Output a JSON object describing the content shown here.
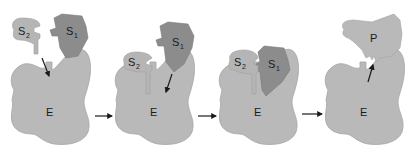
{
  "diagram": {
    "type": "enzyme-substrate mechanism",
    "colors": {
      "enzyme": "#b9b9b9",
      "substrate2": "#b5b5b5",
      "substrate1": "#8c8c8c",
      "product": "#b9b9b9",
      "outline": "#9a9a9a",
      "arrow": "#1a1a1a"
    },
    "panels": [
      {
        "step": 1,
        "enzyme_label": "E",
        "s2_label": "S",
        "s2_sub": "2",
        "s1_label": "S",
        "s1_sub": "1"
      },
      {
        "step": 2,
        "enzyme_label": "E",
        "s2_label": "S",
        "s2_sub": "2",
        "s1_label": "S",
        "s1_sub": "1"
      },
      {
        "step": 3,
        "enzyme_label": "E",
        "s2_label": "S",
        "s2_sub": "2",
        "s1_label": "S",
        "s1_sub": "1"
      },
      {
        "step": 4,
        "enzyme_label": "E",
        "product_label": "P"
      }
    ]
  }
}
